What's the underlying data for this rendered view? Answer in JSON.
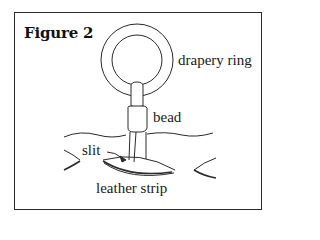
{
  "figure": {
    "title": "Figure 2",
    "labels": {
      "drapery_ring": "drapery ring",
      "bead": "bead",
      "slit": "slit",
      "leather_strip": "leather strip"
    },
    "colors": {
      "line": "#2a2a2a",
      "background": "#ffffff"
    }
  }
}
